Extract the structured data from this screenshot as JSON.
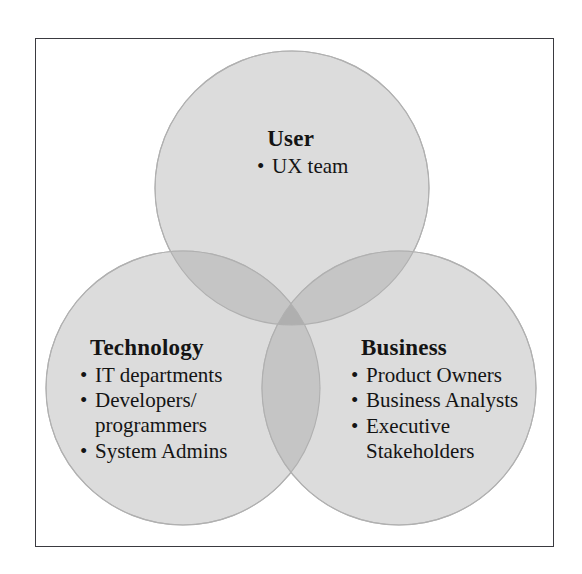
{
  "diagram": {
    "type": "venn-3-circle",
    "frame": {
      "visible": true,
      "border_color": "#3a3a40"
    },
    "background_color": "#ffffff",
    "circle_fill_color": "#d9d9d9",
    "circle_stroke_color": "#b3b3b3",
    "overlap_pair_color": "#bdbdbd",
    "overlap_triple_color": "#a8a8a8",
    "circles": [
      {
        "id": "user",
        "label": "User",
        "cx": 292,
        "cy": 188,
        "r": 137
      },
      {
        "id": "technology",
        "label": "Technology",
        "cx": 183,
        "cy": 388,
        "r": 137
      },
      {
        "id": "business",
        "label": "Business",
        "cx": 399,
        "cy": 388,
        "r": 137
      }
    ]
  },
  "groups": {
    "user": {
      "heading": "User",
      "items": [
        {
          "text": "UX team",
          "continuation": ""
        }
      ]
    },
    "technology": {
      "heading": "Technology",
      "items": [
        {
          "text": "IT departments",
          "continuation": ""
        },
        {
          "text": "Developers/",
          "continuation": "programmers"
        },
        {
          "text": "System Admins",
          "continuation": ""
        }
      ]
    },
    "business": {
      "heading": "Business",
      "items": [
        {
          "text": "Product Owners",
          "continuation": ""
        },
        {
          "text": "Business Analysts",
          "continuation": ""
        },
        {
          "text": "Executive",
          "continuation": "Stakeholders"
        }
      ]
    }
  },
  "symbols": {
    "bullet": "•"
  }
}
